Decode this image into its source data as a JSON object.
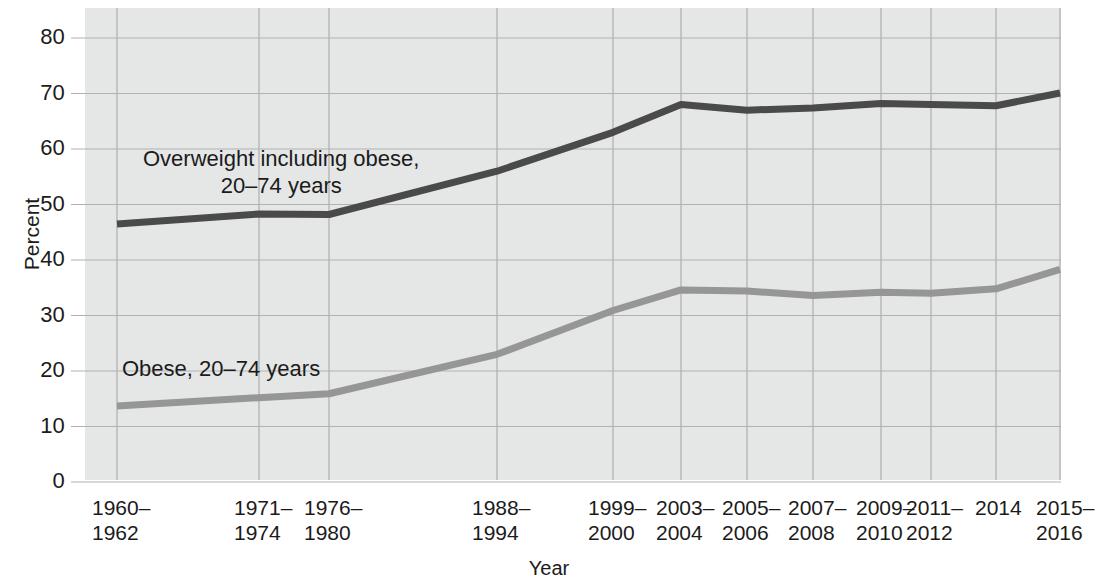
{
  "chart_data": {
    "type": "line",
    "title": "",
    "xlabel": "Year",
    "ylabel": "Percent",
    "ylim": [
      0,
      85
    ],
    "ytick_values": [
      0,
      10,
      20,
      30,
      40,
      50,
      60,
      70,
      80
    ],
    "ytick_labels": [
      "0",
      "10",
      "20",
      "30",
      "40",
      "50",
      "60",
      "70",
      "80"
    ],
    "grid": true,
    "legend_position": "in-plot annotations",
    "categories": [
      "1960–\n1962",
      "1971–\n1974",
      "1976–\n1980",
      "1988–\n1994",
      "1999–\n2000",
      "2003–\n2004",
      "2005–\n2006",
      "2007–\n2008",
      "2009–\n2010",
      "2011–\n2012",
      "2014",
      "2015–\n2016"
    ],
    "series": [
      {
        "name": "Overweight including obese, 20–74 years",
        "color": "#4a4a4a",
        "values": [
          46.5,
          48.3,
          48.2,
          56.0,
          63.0,
          68.0,
          67.0,
          67.4,
          68.2,
          68.0,
          67.8,
          70.1
        ]
      },
      {
        "name": "Obese, 20–74 years",
        "color": "#969696",
        "values": [
          13.7,
          15.2,
          15.9,
          23.0,
          30.9,
          34.6,
          34.4,
          33.6,
          34.2,
          34.0,
          34.8,
          38.3
        ]
      }
    ],
    "annotations": [
      {
        "id": "overweight",
        "text": "Overweight including obese,\n20–74 years"
      },
      {
        "id": "obese",
        "text": "Obese, 20–74 years"
      }
    ]
  },
  "colors": {
    "plot_background": "#e5e6e6",
    "gridline": "#b2b2b2",
    "axis_text": "#1b1b1b",
    "series_dark": "#4a4a4a",
    "series_light": "#969696"
  },
  "axis": {
    "y_title": "Percent",
    "x_title": "Year"
  },
  "ticks": {
    "y": [
      "0",
      "10",
      "20",
      "30",
      "40",
      "50",
      "60",
      "70",
      "80"
    ],
    "x": [
      "1960–\n1962",
      "1971–\n1974",
      "1976–\n1980",
      "1988–\n1994",
      "1999–\n2000",
      "2003–\n2004",
      "2005–\n2006",
      "2007–\n2008",
      "2009–\n2010",
      "2011–\n2012",
      "2014",
      "2015–\n2016"
    ]
  },
  "labels": {
    "overweight": "Overweight including obese,\n20–74 years",
    "obese": "Obese, 20–74 years"
  }
}
